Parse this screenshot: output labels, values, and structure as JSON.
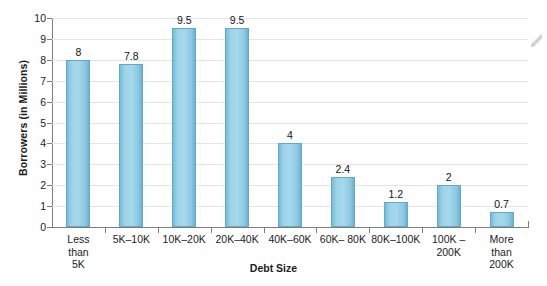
{
  "chart_data": {
    "type": "bar",
    "title": "",
    "xlabel": "Debt Size",
    "ylabel": "Borrowers (in Millions)",
    "categories": [
      "Less\nthan\n5K",
      "5K–10K",
      "10K–20K",
      "20K–40K",
      "40K–60K",
      "60K– 80K",
      "80K–100K",
      "100K – 200K",
      "More\nthan\n200K"
    ],
    "values": [
      8,
      7.8,
      9.5,
      9.5,
      4,
      2.4,
      1.2,
      2,
      0.7
    ],
    "value_labels": [
      "8",
      "7.8",
      "9.5",
      "9.5",
      "4",
      "2.4",
      "1.2",
      "2",
      "0.7"
    ],
    "ylim": [
      0,
      10
    ],
    "yticks": [
      0,
      1,
      2,
      3,
      4,
      5,
      6,
      7,
      8,
      9,
      10
    ],
    "ytick_labels": [
      "0",
      "1",
      "2",
      "3",
      "4",
      "5",
      "6",
      "7",
      "8",
      "9",
      "10"
    ],
    "grid": "horizontal",
    "legend": "none",
    "bar_color": "#9ed4e9",
    "bar_edge_color": "#62a9c9",
    "axis_color": "#7d7d7d",
    "gridline_color": "#e3e4e6",
    "background_color": "#fefefe"
  }
}
